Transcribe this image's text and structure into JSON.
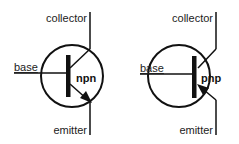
{
  "diagram": {
    "transistors": [
      {
        "type": "npn",
        "labels": {
          "collector": "collector",
          "base": "base",
          "emitter": "emitter",
          "type": "npn"
        },
        "arrow_direction": "outward"
      },
      {
        "type": "pnp",
        "labels": {
          "collector": "collector",
          "base": "base",
          "emitter": "emitter",
          "type": "pnp"
        },
        "arrow_direction": "inward"
      }
    ],
    "colors": {
      "stroke": "#111111",
      "background": "#ffffff"
    }
  }
}
